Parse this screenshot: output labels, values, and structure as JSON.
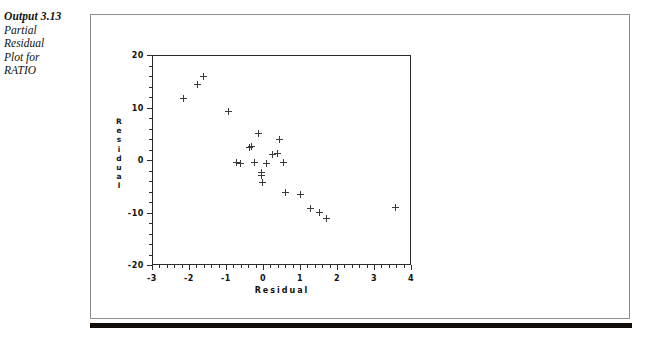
{
  "caption": {
    "title": "Output 3.13",
    "lines": [
      "Partial",
      "Residual",
      "Plot for",
      "RATIO"
    ]
  },
  "colors": {
    "ink": "#2b2b2b",
    "marker": "#3a3a3a",
    "frame": "#8d8d93",
    "rule": "#120d08",
    "background": "#ffffff"
  },
  "chart_data": {
    "type": "scatter",
    "title": "",
    "xlabel": "Residual",
    "ylabel": "Residual",
    "xlim": [
      -3,
      4
    ],
    "ylim": [
      -20,
      20
    ],
    "xticks": [
      -3,
      -2,
      -1,
      0,
      1,
      2,
      3,
      4
    ],
    "xtick_labels": [
      "-3",
      "-2",
      "-1",
      "0",
      "1",
      "2",
      "3",
      "4"
    ],
    "yticks": [
      -20,
      -10,
      0,
      10,
      20
    ],
    "ytick_labels": [
      "-20",
      "-10",
      "0",
      "10",
      "20"
    ],
    "minor_ticks": true,
    "grid": false,
    "legend": null,
    "marker": "plus",
    "points": [
      {
        "x": -2.15,
        "y": 11.7
      },
      {
        "x": -1.78,
        "y": 14.4
      },
      {
        "x": -1.62,
        "y": 16.0
      },
      {
        "x": -0.92,
        "y": 9.2
      },
      {
        "x": -0.72,
        "y": -0.4
      },
      {
        "x": -0.62,
        "y": -0.7
      },
      {
        "x": -0.37,
        "y": 2.4
      },
      {
        "x": -0.3,
        "y": 2.5
      },
      {
        "x": -0.22,
        "y": -0.5
      },
      {
        "x": -0.12,
        "y": 5.1
      },
      {
        "x": -0.05,
        "y": -2.4
      },
      {
        "x": -0.05,
        "y": -3.0
      },
      {
        "x": -0.02,
        "y": -4.3
      },
      {
        "x": 0.1,
        "y": -0.6
      },
      {
        "x": 0.27,
        "y": 1.0
      },
      {
        "x": 0.38,
        "y": 1.3
      },
      {
        "x": 0.45,
        "y": 4.0
      },
      {
        "x": 0.56,
        "y": -0.4
      },
      {
        "x": 0.62,
        "y": -6.2
      },
      {
        "x": 1.02,
        "y": -6.6
      },
      {
        "x": 1.28,
        "y": -9.3
      },
      {
        "x": 1.52,
        "y": -10.0
      },
      {
        "x": 1.72,
        "y": -11.1
      },
      {
        "x": 3.58,
        "y": -9.1
      }
    ]
  }
}
